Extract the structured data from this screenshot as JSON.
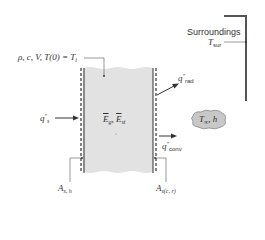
{
  "diagram": {
    "type": "lumped-capacitance control volume",
    "colors": {
      "slab_fill": "#e2e2e2",
      "line": "#333333",
      "cloud_fill": "#c8c8c8",
      "surroundings_wall": "#555555"
    },
    "properties_label": {
      "text": "ρ, c, V, T(0) = T",
      "sub": "i"
    },
    "surroundings": {
      "title": "Surroundings",
      "temp_main": "T",
      "temp_sub": "sur"
    },
    "flux_in": {
      "main": "q",
      "sup": "\"",
      "sub": "s"
    },
    "flux_rad": {
      "main": "q",
      "sup": "\"",
      "sub": "rad"
    },
    "flux_conv": {
      "main": "q",
      "sup": "\"",
      "sub": "conv"
    },
    "energy": {
      "eg": "E",
      "eg_sub": "g",
      "sep": ", ",
      "est": "E",
      "est_sub": "st"
    },
    "fluid": {
      "t": "T",
      "t_sub": "∞",
      "sep": ", ",
      "h": "h"
    },
    "area_left": {
      "main": "A",
      "sub": "s, h"
    },
    "area_right": {
      "main": "A",
      "sub": "s(c, r)"
    }
  }
}
